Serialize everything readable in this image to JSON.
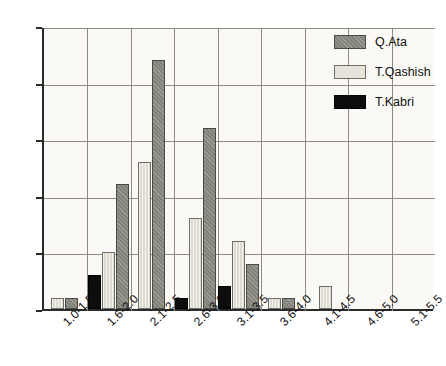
{
  "chart_data": {
    "type": "bar",
    "title": "",
    "subtitle": "",
    "xlabel": "",
    "ylabel": "",
    "ylim": [
      0,
      25
    ],
    "yticks": [
      0,
      5,
      10,
      15,
      20,
      25
    ],
    "grid": true,
    "legend_position": "top-right",
    "categories": [
      "1.0-1.5",
      "1.6-2.0",
      "2.1-2.5",
      "2.6-3.0",
      "3.1-3.5",
      "3.6-4.0",
      "4.1-4.5",
      "4.6-5.0",
      "5.1-5.5"
    ],
    "series": [
      {
        "name": "Q.Ata",
        "color": "#82817a",
        "values": [
          1,
          11,
          22,
          16,
          4,
          1,
          0,
          0,
          0
        ]
      },
      {
        "name": "T.Qashish",
        "color": "#e6e4d9",
        "values": [
          1,
          5,
          13,
          8,
          6,
          1,
          2,
          0,
          0
        ]
      },
      {
        "name": "T.Kabri",
        "color": "#0d0d0d",
        "values": [
          0,
          3,
          0,
          1,
          2,
          0,
          0,
          0,
          0
        ]
      }
    ],
    "bar_order": [
      "T.Kabri",
      "T.Qashish",
      "Q.Ata"
    ]
  },
  "legend": {
    "items": [
      {
        "label": "Q.Ata",
        "swatch": "qata"
      },
      {
        "label": "T.Qashish",
        "swatch": "qashish"
      },
      {
        "label": "T.Kabri",
        "swatch": "kabri"
      }
    ]
  }
}
